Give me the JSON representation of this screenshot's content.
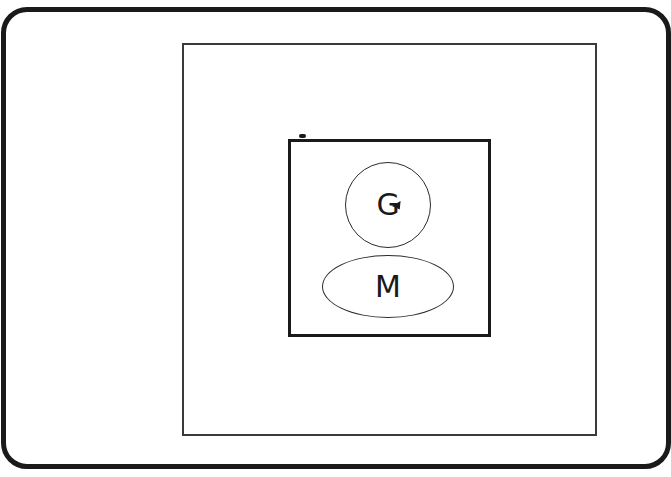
{
  "diagram": {
    "generator_label": "G",
    "motor_label": "M",
    "colors": {
      "stroke": "#1a1a1a",
      "background": "#ffffff"
    }
  }
}
